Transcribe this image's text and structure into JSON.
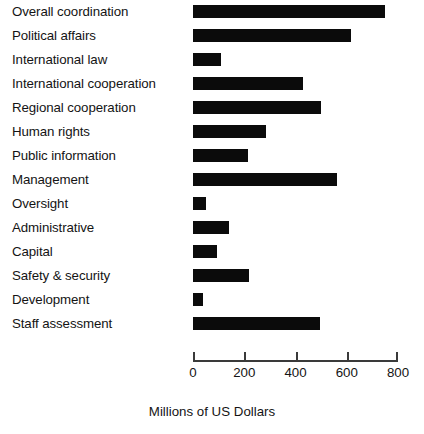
{
  "chart_data": {
    "type": "bar",
    "orientation": "horizontal",
    "title": "",
    "xlabel": "Millions of US Dollars",
    "ylabel": "",
    "xlim": [
      0,
      800
    ],
    "xticks": [
      0,
      200,
      400,
      600,
      800
    ],
    "grid": false,
    "legend": null,
    "bar_color": "#0b0b0b",
    "categories": [
      "Overall coordination",
      "Political affairs",
      "International law",
      "International cooperation",
      "Regional cooperation",
      "Human rights",
      "Public information",
      "Management",
      "Oversight",
      "Administrative",
      "Capital",
      "Safety & security",
      "Development",
      "Staff assessment"
    ],
    "values": [
      750,
      615,
      110,
      430,
      500,
      285,
      215,
      560,
      50,
      140,
      95,
      220,
      40,
      495
    ]
  },
  "axis": {
    "tick_labels": [
      "0",
      "200",
      "400",
      "600",
      "800"
    ],
    "title": "Millions of US Dollars"
  }
}
